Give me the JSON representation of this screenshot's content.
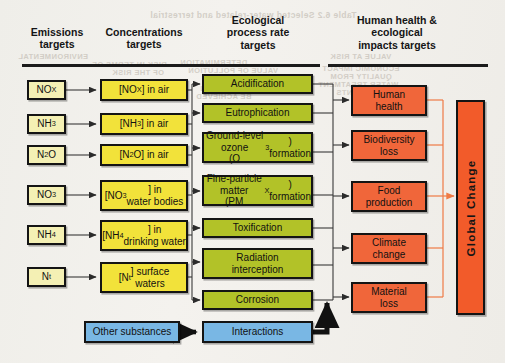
{
  "figure": {
    "kind": "flow-diagram",
    "caption_headers": [
      {
        "id": "emissions",
        "lines": [
          "Emissions",
          "targets"
        ]
      },
      {
        "id": "concentrations",
        "lines": [
          "Concentrations",
          "targets"
        ]
      },
      {
        "id": "ecological",
        "lines": [
          "Ecological",
          "process rate",
          "targets"
        ]
      },
      {
        "id": "impacts",
        "lines": [
          "Human health &",
          "ecological",
          "impacts targets"
        ]
      }
    ]
  },
  "columns": {
    "emissions": {
      "header_line1": "Emissions",
      "header_line2": "targets",
      "items": [
        {
          "id": "nox",
          "html": "NO<sub>X</sub>"
        },
        {
          "id": "nh3",
          "html": "NH<sub>3</sub>"
        },
        {
          "id": "n2o",
          "html": "N<sub>2</sub>O"
        },
        {
          "id": "no3",
          "html": "NO<sub>3</sub>"
        },
        {
          "id": "nh4",
          "html": "NH<sub>4</sub>"
        },
        {
          "id": "nt",
          "html": "N<sub>t</sub>"
        }
      ]
    },
    "concentrations": {
      "header_line1": "Concentrations",
      "header_line2": "targets",
      "items": [
        {
          "id": "nox-air",
          "html": "[NO<sub>X</sub>] in air"
        },
        {
          "id": "nh3-air",
          "html": "[NH<sub>3</sub>] in air"
        },
        {
          "id": "n2o-air",
          "html": "[N<sub>2</sub>O] in air"
        },
        {
          "id": "no3-water",
          "html": "[NO<sub>3</sub>] in<br>water bodies"
        },
        {
          "id": "nh4-drinking",
          "html": "[NH<sub>4</sub>] in<br>drinking water"
        },
        {
          "id": "nt-surface",
          "html": "[N<sub>t</sub>] surface<br>waters"
        }
      ]
    },
    "ecological": {
      "header_line1": "Ecological",
      "header_line2": "process rate",
      "header_line3": "targets",
      "items": [
        {
          "id": "acidification",
          "html": "Acidification"
        },
        {
          "id": "eutrophication",
          "html": "Eutrophication"
        },
        {
          "id": "ozone",
          "html": "Ground-level ozone<br>(O<sub>3</sub>) formation"
        },
        {
          "id": "pm",
          "html": "Fine-particle matter<br>(PM<sub>X</sub>) formation"
        },
        {
          "id": "toxification",
          "html": "Toxification"
        },
        {
          "id": "radiation",
          "html": "Radiation<br>interception"
        },
        {
          "id": "corrosion",
          "html": "Corrosion"
        }
      ]
    },
    "impacts": {
      "header_line1": "Human health &",
      "header_line2": "ecological",
      "header_line3": "impacts targets",
      "items": [
        {
          "id": "human-health",
          "html": "Human<br>health"
        },
        {
          "id": "biodiversity",
          "html": "Biodiversity<br>loss"
        },
        {
          "id": "food",
          "html": "Food<br>production"
        },
        {
          "id": "climate",
          "html": "Climate<br>change"
        },
        {
          "id": "material",
          "html": "Material<br>loss"
        }
      ]
    }
  },
  "bottom_row": {
    "other_substances": "Other substances",
    "interactions": "Interactions"
  },
  "global_change": {
    "label": "Global  Change"
  },
  "colors": {
    "emissions_fill": "#f4f0b4",
    "concentrations_fill": "#f2e23a",
    "ecological_fill": "#b2c228",
    "impacts_fill": "#f0663a",
    "interactions_fill": "#79b7e4",
    "global_change_fill": "#f25b2a",
    "outline": "#141414",
    "orange_connector": "#ef7a45",
    "page_background": "#f1efea"
  },
  "bleed_through": [
    {
      "text": "Table 6.2 Selected water-related and terrestrial",
      "x": 150,
      "y": 10
    },
    {
      "text": "ENVIRONMENTAL",
      "x": 18,
      "y": 52
    },
    {
      "text": "VALUE AT RISK",
      "x": 330,
      "y": 52
    },
    {
      "text": "DETERMINATION",
      "x": 180,
      "y": 58
    },
    {
      "text": "RISK IN TERMS OF",
      "x": 92,
      "y": 60
    },
    {
      "text": "VALUE OF POLLUTION",
      "x": 188,
      "y": 66
    },
    {
      "text": "ECONOMIC IMPACT",
      "x": 322,
      "y": 64
    },
    {
      "text": "OF THE RISK",
      "x": 112,
      "y": 68
    },
    {
      "text": "QUALITY FROM",
      "x": 330,
      "y": 72
    },
    {
      "text": "REMOVAL",
      "x": 206,
      "y": 74
    },
    {
      "text": "WATER TREATMENT",
      "x": 318,
      "y": 80
    },
    {
      "text": "THAT CAN",
      "x": 200,
      "y": 84
    },
    {
      "text": "PLANTS",
      "x": 336,
      "y": 88
    },
    {
      "text": "BE ACHIEVED",
      "x": 196,
      "y": 92
    }
  ]
}
